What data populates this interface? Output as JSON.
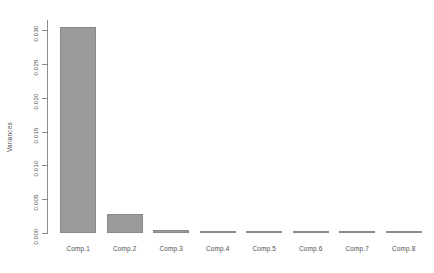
{
  "chart_data": {
    "type": "bar",
    "title": "",
    "xlabel": "",
    "ylabel": "Variances",
    "categories": [
      "Comp.1",
      "Comp.2",
      "Comp.3",
      "Comp.4",
      "Comp.5",
      "Comp.6",
      "Comp.7",
      "Comp.8"
    ],
    "values": [
      0.0305,
      0.00275,
      0.00042,
      0.00028,
      0.00022,
      0.00016,
      0.00012,
      9e-05
    ],
    "ylim": [
      0.0,
      0.0315
    ],
    "yticks": [
      0.0,
      0.005,
      0.01,
      0.015,
      0.02,
      0.025,
      0.03
    ],
    "ytick_labels": [
      "0.000",
      "0.005",
      "0.010",
      "0.015",
      "0.020",
      "0.025",
      "0.030"
    ],
    "grid": false,
    "legend": false,
    "bar_fill": "#9a9a9a",
    "bar_border": "#8a8a8a",
    "axis_color": "#8d8d8d",
    "text_color": "#4d4d4d",
    "background": "#ffffff"
  }
}
